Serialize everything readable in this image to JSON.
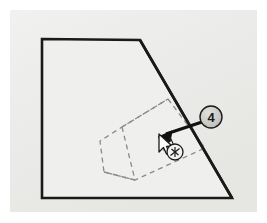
{
  "figure": {
    "domain_note": "technical CAD illustration",
    "panel": {
      "name": "drawing-canvas",
      "background_color": "#ececea",
      "outer_background_color": "#ffffff",
      "x": 10,
      "y": 10,
      "width": 247,
      "height": 202
    },
    "solid_shape": {
      "name": "model-outline",
      "description": "clipped quadrilateral model face",
      "stroke_color": "#1a1a1a",
      "fill_color": "#efefed",
      "stroke_width": 2.6,
      "points": "42,39 140,40 232,198 42,198"
    },
    "dashed_shape": {
      "name": "hidden-prism-wireframe",
      "description": "hidden-line prism behind the face",
      "stroke_color": "#8a8a86",
      "stroke_width": 1.3,
      "dash_pattern": "5,4",
      "outline_points": "168,99 205,148 135,180 104,172 100,141 122,127",
      "edges": [
        "122,127 135,180",
        "122,127 168,99",
        "104,172 135,180"
      ]
    },
    "leader": {
      "name": "callout-leader-arrow",
      "stroke_color": "#111111",
      "stroke_width": 3.2,
      "from_x": 202,
      "from_y": 122,
      "to_x": 161,
      "to_y": 136,
      "arrowhead": "solid-triangle"
    },
    "balloon": {
      "name": "callout-balloon-4",
      "label": "4",
      "center_x": 211,
      "center_y": 117,
      "radius": 11,
      "fill_color": "#c9c9c6",
      "stroke_color": "#1b1b1b",
      "text_color": "#1b1b1b"
    },
    "cursor": {
      "name": "mouse-cursor-pointer",
      "x": 159,
      "y": 134,
      "fill_color": "#fbfbfb",
      "stroke_color": "#1b1b1b"
    },
    "snap_marker": {
      "name": "osnap-indicator",
      "glyph": "crosshair-in-circle",
      "center_x": 175,
      "center_y": 152,
      "radius": 8,
      "fill_color": "#f2f2f0",
      "stroke_color": "#1b1b1b"
    },
    "face_glyph": {
      "name": "face-tag-glyph",
      "center_x": 168,
      "center_y": 143,
      "stroke_color": "#1b1b1b"
    }
  }
}
